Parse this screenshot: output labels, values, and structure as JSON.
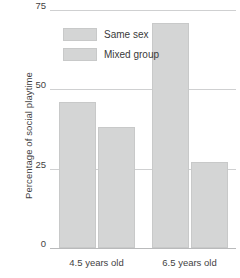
{
  "chart_data": {
    "type": "bar",
    "title": "",
    "xlabel": "",
    "ylabel": "Percentage of social playtime",
    "categories": [
      "4.5 years old",
      "6.5 years old"
    ],
    "series": [
      {
        "name": "Same sex",
        "values": [
          46,
          71
        ]
      },
      {
        "name": "Mixed group",
        "values": [
          38,
          27
        ]
      }
    ],
    "ylim": [
      0,
      75
    ],
    "yticks": [
      0,
      25,
      50,
      75
    ],
    "ytick_labels": [
      "0",
      "25",
      "50",
      "75"
    ],
    "grid": true,
    "legend_position": "upper-left-inside",
    "colors": {
      "bar_fill": "#d4d5d5",
      "bar_stroke": "#c8c9c9",
      "gridline": "#cfd0d1",
      "axis": "#b9babb",
      "text": "#3a3a3a",
      "background": "#ffffff"
    }
  }
}
